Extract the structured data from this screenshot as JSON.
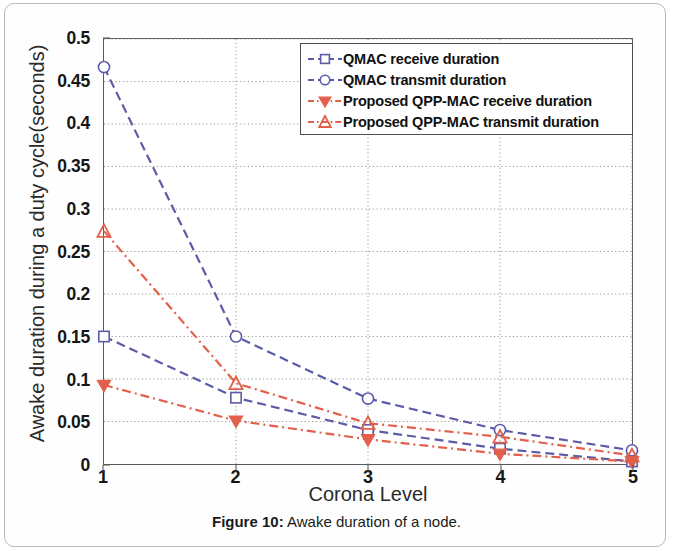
{
  "caption": {
    "prefix": "Figure 10:",
    "text": " Awake duration of a node."
  },
  "colors": {
    "qmac": "#5b5ba8",
    "qpp": "#e2604a",
    "axis": "#4d4d4d",
    "grid": "#8a8a8a",
    "text": "#161616"
  },
  "chart_data": {
    "type": "line",
    "title": "",
    "xlabel": "Corona Level",
    "ylabel": "Awake duration during a duty cycle(seconds)",
    "x": [
      1,
      2,
      3,
      4,
      5
    ],
    "xticklabels": [
      "1",
      "2",
      "3",
      "4",
      "5"
    ],
    "xlim": [
      1,
      5
    ],
    "ylim": [
      0,
      0.5
    ],
    "yticks": [
      0,
      0.05,
      0.1,
      0.15,
      0.2,
      0.25,
      0.3,
      0.35,
      0.4,
      0.45,
      0.5
    ],
    "yticklabels": [
      "0",
      "0.05",
      "0.1",
      "0.15",
      "0.2",
      "0.25",
      "0.3",
      "0.35",
      "0.4",
      "0.45",
      "0.5"
    ],
    "grid": true,
    "legend_position": "top-right",
    "series": [
      {
        "name": "QMAC receive duration",
        "color": "#5b5ba8",
        "marker": "square",
        "linestyle": "dashed",
        "values": [
          0.15,
          0.078,
          0.04,
          0.018,
          0.003
        ]
      },
      {
        "name": "QMAC transmit duration",
        "color": "#5b5ba8",
        "marker": "circle",
        "linestyle": "dashed",
        "values": [
          0.467,
          0.15,
          0.077,
          0.04,
          0.016
        ]
      },
      {
        "name": "Proposed QPP-MAC receive duration",
        "color": "#e2604a",
        "marker": "triangle-down",
        "linestyle": "dashdot",
        "values": [
          0.093,
          0.051,
          0.029,
          0.012,
          0.003
        ]
      },
      {
        "name": "Proposed QPP-MAC transmit duration",
        "color": "#e2604a",
        "marker": "triangle-up",
        "linestyle": "dashdot",
        "values": [
          0.274,
          0.095,
          0.048,
          0.032,
          0.01
        ]
      }
    ]
  },
  "legend": {
    "items": [
      {
        "label": "QMAC receive duration",
        "marker": "square",
        "color": "#5b5ba8",
        "linestyle": "dashed"
      },
      {
        "label": "QMAC transmit duration",
        "marker": "circle",
        "color": "#5b5ba8",
        "linestyle": "dashed"
      },
      {
        "label": "Proposed QPP-MAC receive duration",
        "marker": "triangle-down",
        "color": "#e2604a",
        "linestyle": "dashdot"
      },
      {
        "label": "Proposed QPP-MAC transmit duration",
        "marker": "triangle-up",
        "color": "#e2604a",
        "linestyle": "dashdot"
      }
    ]
  }
}
